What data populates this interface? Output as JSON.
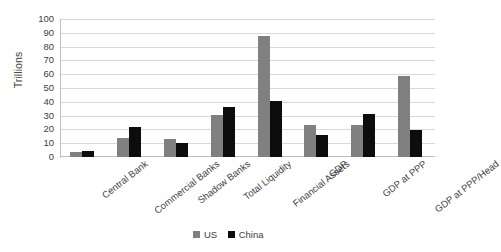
{
  "chart_data": {
    "type": "bar",
    "title": "",
    "xlabel": "",
    "ylabel": "Trillions",
    "ylim": [
      0,
      100
    ],
    "ytick_step": 10,
    "yticks": [
      100,
      90,
      80,
      70,
      60,
      50,
      40,
      30,
      20,
      10,
      0
    ],
    "grid": true,
    "legend_position": "bottom-center",
    "categories": [
      "Central Bank",
      "Commercial Banks",
      "Shadow Banks",
      "Total Liquidity",
      "Financial Assets",
      "GDP",
      "GDP at PPP",
      "GDP at PPP/Head"
    ],
    "series": [
      {
        "name": "US",
        "color": "#808080",
        "values": [
          3.5,
          14,
          13,
          30.5,
          87.5,
          23,
          23,
          59
        ]
      },
      {
        "name": "China",
        "color": "#0d0d0d",
        "values": [
          4.5,
          22,
          10,
          36,
          40.5,
          16,
          31,
          19.5
        ]
      }
    ]
  },
  "legend": {
    "items": [
      {
        "label": "US",
        "color": "#808080"
      },
      {
        "label": "China",
        "color": "#0d0d0d"
      }
    ]
  }
}
